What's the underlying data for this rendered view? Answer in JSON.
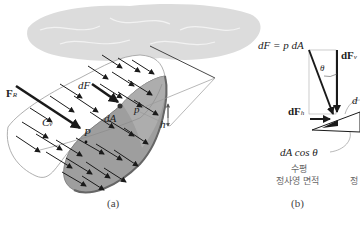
{
  "figure": {
    "panel_a": {
      "caption": "(a)",
      "labels": {
        "resultant_force": "F",
        "resultant_force_sub": "R",
        "element_force": "dF",
        "centroid": "C",
        "centroid_sub": "v",
        "area_element": "dA",
        "pressure_point": "P",
        "pressure": "p",
        "depth": "h"
      }
    },
    "panel_b": {
      "caption": "(b)",
      "labels": {
        "equation": "dF = p dA",
        "vertical_force": "dF",
        "vertical_force_sub": "v",
        "horizontal_force": "dF",
        "horizontal_force_sub": "h",
        "angle": "θ",
        "area_label_partial": "d",
        "projected_area": "dA cos θ",
        "korean_line1": "수평",
        "korean_line2": "정사영 면적",
        "korean_partial": "정"
      }
    },
    "colors": {
      "surface_front": "#9e9e9e",
      "surface_back": "#ffffff",
      "fluid_cloud": "#dcdcdc",
      "arrow": "#1a1a1a"
    }
  }
}
